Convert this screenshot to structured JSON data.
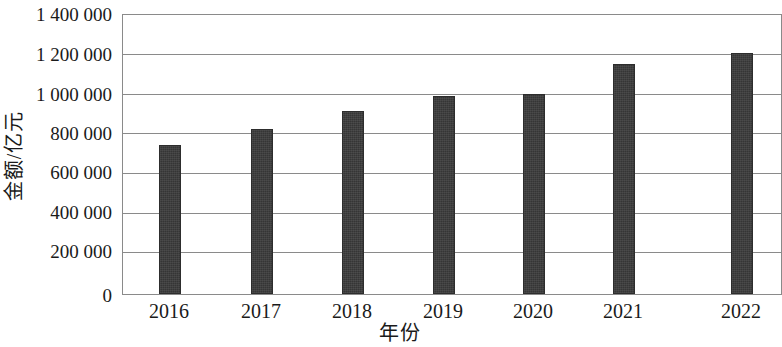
{
  "chart_data": {
    "type": "bar",
    "title": "",
    "subtitle": "",
    "xlabel": "年份",
    "ylabel": "金额/亿元",
    "categories": [
      "2016",
      "2017",
      "2018",
      "2019",
      "2020",
      "2021",
      "2022"
    ],
    "values": [
      740000,
      820000,
      910000,
      985000,
      995000,
      1145000,
      1200000
    ],
    "series": [
      {
        "name": "金额/亿元",
        "values": [
          740000,
          820000,
          910000,
          985000,
          995000,
          1145000,
          1200000
        ]
      }
    ],
    "ylim": [
      0,
      1400000
    ],
    "ytick_values": [
      0,
      200000,
      400000,
      600000,
      800000,
      1000000,
      1200000,
      1400000
    ],
    "ytick_labels": [
      "0",
      "200 000",
      "400 000",
      "600 000",
      "800 000",
      "1 000 000",
      "1 200 000",
      "1 400 000"
    ],
    "grid": true,
    "grid_axis": "y",
    "legend": false,
    "legend_position": "none",
    "bar_color": "#3a3a3a",
    "axis_color": "#8a8a8a",
    "background_color": "#ffffff",
    "annotations": []
  }
}
